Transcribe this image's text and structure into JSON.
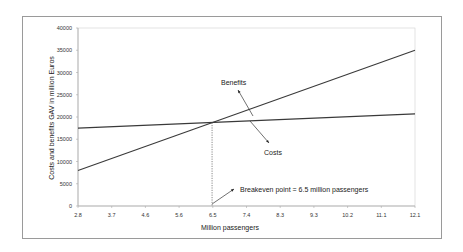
{
  "chart_data": {
    "type": "line",
    "title": "",
    "xlabel": "Million passengers",
    "ylabel": "Costs and benefits GAV in million Euros",
    "x_ticks": [
      "2.8",
      "3.7",
      "4.6",
      "5.6",
      "6.5",
      "7.4",
      "8.3",
      "9.3",
      "10.2",
      "11.1",
      "12.1"
    ],
    "y_ticks": [
      "0",
      "5000",
      "10000",
      "15000",
      "20000",
      "25000",
      "30000",
      "35000",
      "40000"
    ],
    "xlim": [
      2.8,
      12.1
    ],
    "ylim": [
      0,
      40000
    ],
    "grid": false,
    "legend": "none (inline annotations)",
    "series": [
      {
        "name": "Benefits",
        "x": [
          2.8,
          12.1
        ],
        "values": [
          8000,
          35000
        ]
      },
      {
        "name": "Costs",
        "x": [
          2.8,
          12.1
        ],
        "values": [
          17500,
          20700
        ]
      }
    ],
    "annotations": [
      {
        "text": "Benefits",
        "points_to": "Benefits line"
      },
      {
        "text": "Costs",
        "points_to": "Costs line"
      },
      {
        "text": "Breakeven point = 6.5 million passengers",
        "x": 6.5,
        "y": 18800
      }
    ]
  },
  "labels": {
    "xlabel": "Million passengers",
    "ylabel": "Costs and benefits GAV in million Euros",
    "benefits": "Benefits",
    "costs": "Costs",
    "breakeven": "Breakeven point = 6.5 million passengers"
  },
  "colors": {
    "line": "#3a3a3a",
    "axis": "#aaaaaa",
    "frame": "#9a9a9a"
  }
}
